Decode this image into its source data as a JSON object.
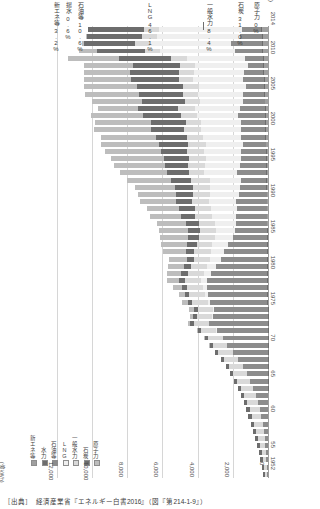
{
  "chart_data": {
    "type": "bar",
    "title": "",
    "orientation": "horizontal-rotated",
    "unit_label": "(億kWh)",
    "xlabel": "(億kWh)",
    "ylabel": "(年度)",
    "xlim": [
      0,
      12000
    ],
    "xticks": [
      "12,000",
      "10,000",
      "8,000",
      "6,000",
      "4,000",
      "2,000",
      "0"
    ],
    "xtick_values": [
      12000,
      10000,
      8000,
      6000,
      4000,
      2000,
      0
    ],
    "grid": true,
    "legend_position": "bottom-left",
    "stacked": true,
    "categories": [
      "2014",
      "2013",
      "2012",
      "2011",
      "2010",
      "2009",
      "2008",
      "2007",
      "2006",
      "2005",
      "2004",
      "2003",
      "2002",
      "2001",
      "2000",
      "1999",
      "1998",
      "1997",
      "1996",
      "1995",
      "1994",
      "1993",
      "1992",
      "1991",
      "1990",
      "1989",
      "1988",
      "1987",
      "1986",
      "1985",
      "1984",
      "1983",
      "1982",
      "1981",
      "1980",
      "1979",
      "1978",
      "1977",
      "1976",
      "1975",
      "1974",
      "1973",
      "1972",
      "1971",
      "1970",
      "1969",
      "1968",
      "1967",
      "1966",
      "1965",
      "1964",
      "1963",
      "1962",
      "1961",
      "1960",
      "1959",
      "1958",
      "1957",
      "1956",
      "1955",
      "1954",
      "1953",
      "1952"
    ],
    "year_tick_labels": [
      "2014",
      "2010",
      "2005",
      "2000",
      "1995",
      "1990",
      "1985",
      "1980",
      "1975",
      "70",
      "65",
      "60",
      "55",
      "1952"
    ],
    "series": [
      {
        "name": "新エネ等",
        "color": "#9f9f9f",
        "values": [
          331,
          310,
          290,
          265,
          240,
          225,
          210,
          195,
          180,
          165,
          150,
          140,
          130,
          120,
          110,
          100,
          92,
          85,
          78,
          70,
          64,
          58,
          52,
          47,
          42,
          38,
          34,
          30,
          27,
          24,
          21,
          19,
          17,
          15,
          13,
          12,
          11,
          10,
          9,
          8,
          7,
          6,
          6,
          5,
          5,
          4,
          4,
          3,
          3,
          3,
          2,
          2,
          2,
          2,
          2,
          1,
          1,
          1,
          1,
          1,
          1,
          1,
          1
        ]
      },
      {
        "name": "水力",
        "color": "#6d6d6d",
        "values": [
          62,
          60,
          58,
          56,
          55,
          54,
          53,
          52,
          51,
          50,
          49,
          48,
          47,
          46,
          45,
          44,
          43,
          42,
          41,
          40,
          39,
          38,
          37,
          36,
          35,
          34,
          33,
          32,
          31,
          30,
          29,
          28,
          27,
          26,
          25,
          24,
          23,
          22,
          21,
          20,
          19,
          18,
          17,
          16,
          15,
          14,
          13,
          12,
          11,
          10,
          9,
          8,
          8,
          7,
          7,
          6,
          6,
          5,
          5,
          5,
          4,
          4,
          4
        ]
      },
      {
        "name": "石油等",
        "color": "#8c8c8c",
        "values": [
          1090,
          1240,
          1760,
          1580,
          990,
          880,
          1080,
          1160,
          1020,
          1190,
          1230,
          1430,
          1520,
          1350,
          1400,
          1380,
          1300,
          1420,
          1390,
          1500,
          1650,
          1460,
          1520,
          1580,
          1720,
          1700,
          1760,
          1740,
          1830,
          1960,
          2250,
          2450,
          2620,
          2900,
          3180,
          3460,
          3420,
          3380,
          3260,
          3040,
          3120,
          3340,
          2900,
          2550,
          2300,
          2000,
          1700,
          1420,
          1200,
          1000,
          820,
          680,
          560,
          460,
          380,
          300,
          240,
          190,
          150,
          120,
          95,
          75,
          58
        ]
      },
      {
        "name": "LNG",
        "color": "#efefef",
        "values": [
          4720,
          4730,
          4600,
          4220,
          3340,
          2980,
          2870,
          2840,
          2670,
          2550,
          2430,
          2560,
          2330,
          2280,
          2280,
          2160,
          2120,
          2100,
          2020,
          1970,
          1880,
          1760,
          1700,
          1640,
          1560,
          1460,
          1380,
          1240,
          1100,
          980,
          860,
          760,
          640,
          540,
          420,
          330,
          250,
          180,
          120,
          70,
          40,
          25,
          15,
          8,
          4,
          2,
          1,
          0,
          0,
          0,
          0,
          0,
          0,
          0,
          0,
          0,
          0,
          0,
          0,
          0,
          0,
          0,
          0
        ]
      },
      {
        "name": "一般水力",
        "color": "#d9d9d9",
        "values": [
          860,
          850,
          840,
          860,
          900,
          840,
          830,
          810,
          900,
          880,
          890,
          930,
          930,
          880,
          960,
          920,
          1000,
          940,
          960,
          980,
          880,
          1080,
          960,
          980,
          980,
          950,
          930,
          900,
          870,
          920,
          900,
          930,
          880,
          920,
          940,
          920,
          880,
          900,
          890,
          870,
          860,
          850,
          860,
          860,
          840,
          820,
          800,
          780,
          760,
          740,
          700,
          660,
          620,
          580,
          540,
          480,
          420,
          360,
          300,
          250,
          200,
          160,
          120
        ]
      },
      {
        "name": "石炭",
        "color": "#6d6d6d",
        "values": [
          3180,
          3080,
          2900,
          2750,
          2950,
          2680,
          2820,
          2760,
          2630,
          2530,
          2420,
          2280,
          2140,
          2000,
          1880,
          1760,
          1620,
          1520,
          1420,
          1320,
          1220,
          1120,
          1040,
          980,
          920,
          860,
          800,
          740,
          680,
          620,
          560,
          500,
          440,
          400,
          360,
          320,
          290,
          260,
          240,
          220,
          200,
          190,
          180,
          175,
          170,
          170,
          170,
          170,
          175,
          180,
          185,
          190,
          195,
          200,
          205,
          200,
          190,
          180,
          170,
          160,
          140,
          120,
          100
        ]
      },
      {
        "name": "原子力",
        "color": "#bdbdbd",
        "values": [
          0,
          90,
          159,
          1018,
          2882,
          2798,
          2581,
          2638,
          3034,
          3048,
          2823,
          2303,
          2950,
          3190,
          3220,
          3160,
          3320,
          3190,
          3020,
          2910,
          2700,
          2490,
          2230,
          2140,
          2020,
          1850,
          1780,
          1620,
          1680,
          1590,
          1450,
          1270,
          1020,
          870,
          820,
          690,
          550,
          330,
          360,
          250,
          200,
          110,
          90,
          70,
          46,
          30,
          20,
          10,
          5,
          4,
          3,
          2,
          1,
          1,
          0,
          0,
          0,
          0,
          0,
          0,
          0,
          0,
          0
        ]
      }
    ],
    "annotations": [
      {
        "label": "新エネ等",
        "value": "3.2%"
      },
      {
        "label": "揚水",
        "value": "0.6%"
      },
      {
        "label": "石油等",
        "value": "10.6%"
      },
      {
        "label": "LNG",
        "value": "46.1%"
      },
      {
        "label": "一般水力",
        "value": "8.4%"
      },
      {
        "label": "石炭",
        "value": "31.0%"
      },
      {
        "label": "原子力",
        "value": "0%"
      }
    ]
  },
  "legend": {
    "items": [
      {
        "label": "新エネ等",
        "color": "#9f9f9f"
      },
      {
        "label": "水力",
        "color": "#6d6d6d"
      },
      {
        "label": "石油等",
        "color": "#8c8c8c"
      },
      {
        "label": "LNG",
        "color": "#efefef"
      },
      {
        "label": "一般水力",
        "color": "#d9d9d9"
      },
      {
        "label": "石炭",
        "color": "#6d6d6d"
      },
      {
        "label": "原子力",
        "color": "#bdbdbd"
      }
    ]
  },
  "axes": {
    "unit_label": "(億kWh)",
    "year_axis_label": "(年度)",
    "xticks": [
      "12,000",
      "10,000",
      "8,000",
      "6,000",
      "4,000",
      "2,000",
      "0"
    ],
    "year_labels": [
      "2014",
      "2010",
      "2005",
      "2000",
      "1995",
      "1990",
      "1985",
      "1980",
      "1975",
      "70",
      "65",
      "60",
      "55",
      "1952"
    ]
  },
  "annotations": {
    "a0_label": "新エネ等",
    "a0_value": "3.2%",
    "a1_label": "揚水",
    "a1_value": "0.6%",
    "a2_label": "石油等",
    "a2_value": "10.6%",
    "a3_label": "LNG",
    "a3_value": "46.1%",
    "a4_label": "一般水力",
    "a4_value": "8.4%",
    "a5_label": "石炭",
    "a5_value": "31.0%",
    "a6_label": "原子力",
    "a6_value": "0%"
  },
  "source": {
    "text": "［出典］　経済産業省『エネルギー白書2016』（図『第214-1-9』）"
  }
}
